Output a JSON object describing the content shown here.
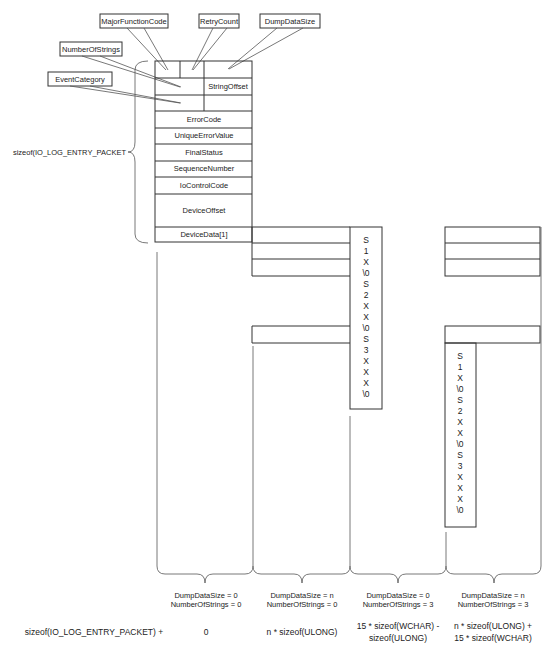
{
  "callouts": {
    "major_function_code": "MajorFunctionCode",
    "retry_count": "RetryCount",
    "dump_data_size": "DumpDataSize",
    "number_of_strings": "NumberOfStrings",
    "event_category": "EventCategory"
  },
  "struct": {
    "string_offset": "StringOffset",
    "fields": [
      "ErrorCode",
      "UniqueErrorValue",
      "FinalStatus",
      "SequenceNumber",
      "IoControlCode",
      "DeviceOffset",
      "DeviceData[1]"
    ]
  },
  "left_brace_label": "sizeof(IO_LOG_ENTRY_PACKET",
  "string_chars": [
    "S",
    "1",
    "X",
    "\\0",
    "S",
    "2",
    "X",
    "X",
    "\\0",
    "S",
    "3",
    "X",
    "X",
    "X",
    "\\0"
  ],
  "cases": [
    {
      "dump": "DumpDataSize = 0",
      "strings": "NumberOfStrings = 0",
      "size_line1": "0",
      "size_line2": ""
    },
    {
      "dump": "DumpDataSize = n",
      "strings": "NumberOfStrings = 0",
      "size_line1": "n * sizeof(ULONG)",
      "size_line2": ""
    },
    {
      "dump": "DumpDataSize = 0",
      "strings": "NumberOfStrings = 3",
      "size_line1": "15 * sizeof(WCHAR) -",
      "size_line2": "sizeof(ULONG)"
    },
    {
      "dump": "DumpDataSize = n",
      "strings": "NumberOfStrings = 3",
      "size_line1": "n * sizeof(ULONG) +",
      "size_line2": "15 * sizeof(WCHAR)"
    }
  ],
  "size_prefix": "sizeof(IO_LOG_ENTRY_PACKET) +"
}
